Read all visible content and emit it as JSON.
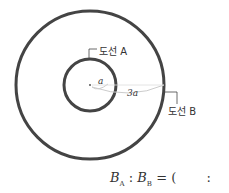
{
  "diagram": {
    "wire_a_label": "도선 A",
    "wire_b_label": "도선 B",
    "inner_radius_label": "a",
    "outer_radius_label": "3a"
  },
  "formula": {
    "b": "B",
    "sub_a": "A",
    "sub_b": "B",
    "colon": ":",
    "equals": "=",
    "open_paren": "(",
    "blank_colon": ":"
  }
}
